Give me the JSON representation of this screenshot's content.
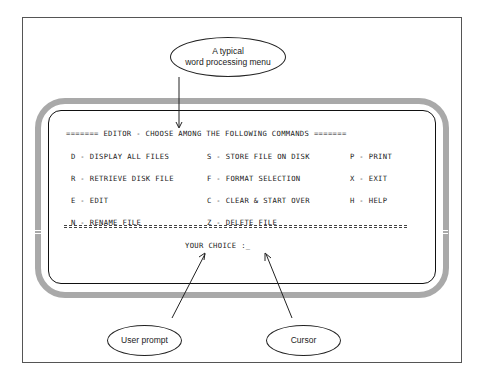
{
  "figure": {
    "top_callout": {
      "line1": "A typical",
      "line2": "word processing menu"
    },
    "screen": {
      "header": "======= EDITOR - CHOOSE AMONG THE FOLLOWING COMMANDS =======",
      "commands": [
        {
          "key": "D",
          "label": "D - DISPLAY ALL FILES"
        },
        {
          "key": "S",
          "label": "S - STORE FILE ON DISK"
        },
        {
          "key": "P",
          "label": "P - PRINT"
        },
        {
          "key": "R",
          "label": "R - RETRIEVE DISK FILE"
        },
        {
          "key": "F",
          "label": "F - FORMAT SELECTION"
        },
        {
          "key": "X",
          "label": "X - EXIT"
        },
        {
          "key": "E",
          "label": "E - EDIT"
        },
        {
          "key": "C",
          "label": "C - CLEAR & START OVER"
        },
        {
          "key": "H",
          "label": "H - HELP"
        },
        {
          "key": "N",
          "label": "N - RENAME FILE"
        },
        {
          "key": "Z",
          "label": "Z - DELETE FILE"
        }
      ],
      "prompt": "YOUR CHOICE :_"
    },
    "bottom_callouts": {
      "user_prompt": "User prompt",
      "cursor": "Cursor"
    },
    "colors": {
      "frame_gray": "#a9a9a9",
      "ink": "#222222",
      "background": "#ffffff"
    }
  }
}
